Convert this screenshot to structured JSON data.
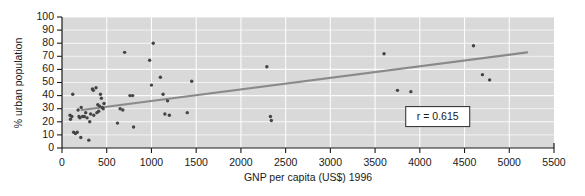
{
  "chart_data": {
    "type": "scatter",
    "title": "",
    "xlabel": "GNP per capita (US$) 1996",
    "ylabel": "% urban population",
    "xlim": [
      0,
      5500
    ],
    "ylim": [
      0,
      100
    ],
    "xticks": [
      0,
      500,
      1000,
      1500,
      2000,
      2500,
      3000,
      3500,
      4000,
      4500,
      5000,
      5500
    ],
    "yticks": [
      0,
      10,
      20,
      30,
      40,
      50,
      60,
      70,
      80,
      90,
      100
    ],
    "grid": true,
    "legend": "none",
    "plot_background": "#d9d9d9",
    "marker_color": "#444444",
    "trendline_color": "#8a8a8a",
    "annotations": [
      {
        "name": "correlation-box",
        "text": "r = 0.615",
        "x": 4200,
        "y": 24
      }
    ],
    "trendline": {
      "name": "regression-line",
      "x": [
        220,
        5200
      ],
      "y": [
        29,
        73
      ]
    },
    "points": [
      {
        "x": 90,
        "y": 25
      },
      {
        "x": 95,
        "y": 22
      },
      {
        "x": 110,
        "y": 24
      },
      {
        "x": 120,
        "y": 41
      },
      {
        "x": 130,
        "y": 12
      },
      {
        "x": 150,
        "y": 11
      },
      {
        "x": 170,
        "y": 12
      },
      {
        "x": 180,
        "y": 29
      },
      {
        "x": 190,
        "y": 24
      },
      {
        "x": 200,
        "y": 23
      },
      {
        "x": 210,
        "y": 8
      },
      {
        "x": 215,
        "y": 31
      },
      {
        "x": 230,
        "y": 24
      },
      {
        "x": 250,
        "y": 24
      },
      {
        "x": 265,
        "y": 27
      },
      {
        "x": 280,
        "y": 23
      },
      {
        "x": 300,
        "y": 6
      },
      {
        "x": 310,
        "y": 20
      },
      {
        "x": 320,
        "y": 26
      },
      {
        "x": 340,
        "y": 45
      },
      {
        "x": 350,
        "y": 44
      },
      {
        "x": 355,
        "y": 25
      },
      {
        "x": 380,
        "y": 46
      },
      {
        "x": 390,
        "y": 27
      },
      {
        "x": 400,
        "y": 33
      },
      {
        "x": 410,
        "y": 28
      },
      {
        "x": 420,
        "y": 32
      },
      {
        "x": 430,
        "y": 41
      },
      {
        "x": 440,
        "y": 38
      },
      {
        "x": 450,
        "y": 31
      },
      {
        "x": 460,
        "y": 30
      },
      {
        "x": 470,
        "y": 34
      },
      {
        "x": 620,
        "y": 19
      },
      {
        "x": 650,
        "y": 30
      },
      {
        "x": 680,
        "y": 29
      },
      {
        "x": 700,
        "y": 73
      },
      {
        "x": 760,
        "y": 40
      },
      {
        "x": 790,
        "y": 40
      },
      {
        "x": 800,
        "y": 16
      },
      {
        "x": 980,
        "y": 67
      },
      {
        "x": 1000,
        "y": 48
      },
      {
        "x": 1020,
        "y": 80
      },
      {
        "x": 1100,
        "y": 54
      },
      {
        "x": 1130,
        "y": 41
      },
      {
        "x": 1150,
        "y": 26
      },
      {
        "x": 1180,
        "y": 36
      },
      {
        "x": 1200,
        "y": 25
      },
      {
        "x": 1400,
        "y": 27
      },
      {
        "x": 1450,
        "y": 51
      },
      {
        "x": 2290,
        "y": 62
      },
      {
        "x": 2330,
        "y": 24
      },
      {
        "x": 2340,
        "y": 21
      },
      {
        "x": 3600,
        "y": 72
      },
      {
        "x": 3750,
        "y": 44
      },
      {
        "x": 3900,
        "y": 43
      },
      {
        "x": 4600,
        "y": 78
      },
      {
        "x": 4700,
        "y": 56
      },
      {
        "x": 4780,
        "y": 52
      }
    ]
  }
}
